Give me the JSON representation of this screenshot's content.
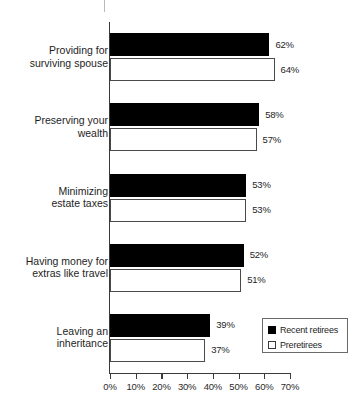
{
  "chart_data": {
    "type": "bar",
    "orientation": "horizontal",
    "title": "",
    "xlabel": "",
    "ylabel": "",
    "xlim": [
      0,
      70
    ],
    "xtick_step": 10,
    "grid": false,
    "legend_position": "bottom-right",
    "categories": [
      "Providing for\nsurviving spouse",
      "Preserving your\nwealth",
      "Minimizing\nestate taxes",
      "Having money for\nextras like travel",
      "Leaving an\ninheritance"
    ],
    "tick_labels": [
      "0%",
      "10%",
      "20%",
      "30%",
      "40%",
      "50%",
      "60%",
      "70%"
    ],
    "tick_values": [
      0,
      10,
      20,
      30,
      40,
      50,
      60,
      70
    ],
    "series": [
      {
        "name": "Recent retirees",
        "style": "filled",
        "color": "#000000",
        "values": [
          62,
          58,
          53,
          52,
          39
        ],
        "value_labels": [
          "62%",
          "58%",
          "53%",
          "52%",
          "39%"
        ]
      },
      {
        "name": "Preretirees",
        "style": "outlined",
        "color": "#ffffff",
        "border_color": "#4a4a4a",
        "values": [
          64,
          57,
          53,
          51,
          37
        ],
        "value_labels": [
          "64%",
          "57%",
          "53%",
          "51%",
          "37%"
        ]
      }
    ]
  },
  "legend": {
    "entries": [
      {
        "label": "Recent retirees",
        "swatch": "filled-square-icon"
      },
      {
        "label": "Preretirees",
        "swatch": "outlined-square-icon"
      }
    ]
  },
  "colors": {
    "series_recent_retirees": "#000000",
    "series_preretirees": "#ffffff",
    "axis": "#3a3a3a",
    "text": "#1e1e1e",
    "background": "#ffffff"
  }
}
